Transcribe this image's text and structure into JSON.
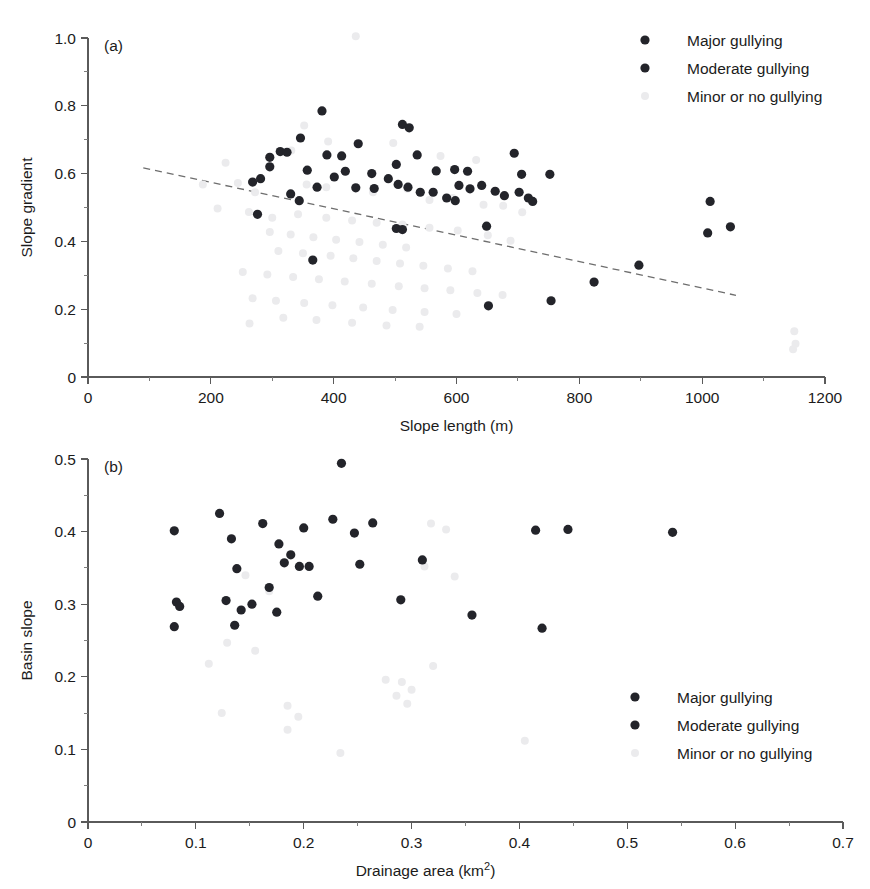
{
  "figure": {
    "width": 870,
    "height": 889,
    "background": "#ffffff",
    "colors": {
      "major": "#23242a",
      "moderate": "#23242a",
      "minor": "#ebebed",
      "axis": "#5a5a5a",
      "trendline": "#6e6e6e",
      "text": "#1b1b1b"
    }
  },
  "legend": {
    "entries": [
      {
        "key": "major",
        "label": "Major gullying",
        "color": "#23242a"
      },
      {
        "key": "moderate",
        "label": "Moderate gullying",
        "color": "#23242a"
      },
      {
        "key": "minor",
        "label": "Minor or no gullying",
        "color": "#ebebed"
      }
    ]
  },
  "chart_data": [
    {
      "id": "panel-a",
      "type": "scatter",
      "panel_label": "(a)",
      "title": "",
      "xlabel": "Slope length (m)",
      "ylabel": "Slope gradient",
      "xlim": [
        0,
        1200
      ],
      "ylim": [
        0,
        1.0
      ],
      "xticks": [
        0,
        200,
        400,
        600,
        800,
        1000,
        1200
      ],
      "xticklabels": [
        "0",
        "200",
        "400",
        "600",
        "800",
        "1000",
        "1200"
      ],
      "yticks": [
        0,
        0.2,
        0.4,
        0.6,
        0.8,
        1.0
      ],
      "yticklabels": [
        "0",
        "0.2",
        "0.4",
        "0.6",
        "0.8",
        "1.0"
      ],
      "xminor_step": 100,
      "yminor_step": 0.1,
      "grid": false,
      "legend_position": "top-right",
      "trendline": {
        "style": "dashed",
        "x": [
          90,
          1055
        ],
        "y": [
          0.617,
          0.241
        ]
      },
      "series": [
        {
          "name": "Major gullying",
          "key": "major",
          "color": "#23242a",
          "points": [
            [
              381,
              0.785
            ],
            [
              346,
              0.705
            ],
            [
              512,
              0.745
            ],
            [
              523,
              0.735
            ],
            [
              313,
              0.665
            ],
            [
              324,
              0.663
            ],
            [
              296,
              0.648
            ],
            [
              389,
              0.655
            ],
            [
              413,
              0.652
            ],
            [
              440,
              0.688
            ],
            [
              296,
              0.62
            ],
            [
              357,
              0.61
            ],
            [
              419,
              0.607
            ],
            [
              401,
              0.59
            ],
            [
              462,
              0.6
            ],
            [
              502,
              0.627
            ],
            [
              536,
              0.655
            ],
            [
              567,
              0.608
            ],
            [
              597,
              0.612
            ],
            [
              618,
              0.607
            ],
            [
              694,
              0.66
            ],
            [
              706,
              0.598
            ],
            [
              752,
              0.598
            ],
            [
              268,
              0.575
            ],
            [
              281,
              0.585
            ],
            [
              330,
              0.54
            ],
            [
              373,
              0.56
            ],
            [
              436,
              0.558
            ],
            [
              466,
              0.556
            ],
            [
              489,
              0.585
            ],
            [
              505,
              0.568
            ],
            [
              521,
              0.56
            ],
            [
              541,
              0.545
            ],
            [
              562,
              0.545
            ],
            [
              584,
              0.528
            ],
            [
              604,
              0.565
            ],
            [
              622,
              0.555
            ],
            [
              641,
              0.565
            ],
            [
              663,
              0.548
            ],
            [
              678,
              0.535
            ],
            [
              702,
              0.545
            ],
            [
              717,
              0.528
            ],
            [
              724,
              0.518
            ],
            [
              276,
              0.48
            ],
            [
              344,
              0.52
            ],
            [
              502,
              0.438
            ],
            [
              512,
              0.435
            ],
            [
              598,
              0.52
            ],
            [
              649,
              0.445
            ],
            [
              1013,
              0.518
            ],
            [
              1009,
              0.425
            ],
            [
              1046,
              0.443
            ],
            [
              652,
              0.21
            ],
            [
              754,
              0.225
            ],
            [
              824,
              0.28
            ],
            [
              897,
              0.33
            ],
            [
              366,
              0.345
            ]
          ]
        },
        {
          "name": "Minor or no gullying",
          "key": "minor",
          "color": "#ebebed",
          "points": [
            [
              436,
              1.005
            ],
            [
              352,
              0.742
            ],
            [
              224,
              0.632
            ],
            [
              331,
              0.668
            ],
            [
              391,
              0.695
            ],
            [
              497,
              0.69
            ],
            [
              574,
              0.652
            ],
            [
              632,
              0.64
            ],
            [
              187,
              0.568
            ],
            [
              244,
              0.572
            ],
            [
              272,
              0.545
            ],
            [
              356,
              0.568
            ],
            [
              388,
              0.56
            ],
            [
              464,
              0.545
            ],
            [
              520,
              0.555
            ],
            [
              556,
              0.522
            ],
            [
              594,
              0.528
            ],
            [
              644,
              0.508
            ],
            [
              676,
              0.505
            ],
            [
              707,
              0.486
            ],
            [
              211,
              0.497
            ],
            [
              262,
              0.487
            ],
            [
              300,
              0.47
            ],
            [
              342,
              0.48
            ],
            [
              388,
              0.47
            ],
            [
              430,
              0.462
            ],
            [
              470,
              0.455
            ],
            [
              512,
              0.45
            ],
            [
              556,
              0.44
            ],
            [
              602,
              0.432
            ],
            [
              651,
              0.418
            ],
            [
              688,
              0.402
            ],
            [
              296,
              0.428
            ],
            [
              330,
              0.42
            ],
            [
              367,
              0.412
            ],
            [
              404,
              0.405
            ],
            [
              442,
              0.398
            ],
            [
              480,
              0.39
            ],
            [
              518,
              0.382
            ],
            [
              310,
              0.372
            ],
            [
              350,
              0.365
            ],
            [
              395,
              0.358
            ],
            [
              432,
              0.35
            ],
            [
              470,
              0.342
            ],
            [
              508,
              0.335
            ],
            [
              546,
              0.328
            ],
            [
              586,
              0.32
            ],
            [
              626,
              0.312
            ],
            [
              252,
              0.31
            ],
            [
              292,
              0.302
            ],
            [
              334,
              0.295
            ],
            [
              376,
              0.288
            ],
            [
              418,
              0.282
            ],
            [
              462,
              0.275
            ],
            [
              506,
              0.268
            ],
            [
              548,
              0.262
            ],
            [
              590,
              0.256
            ],
            [
              634,
              0.248
            ],
            [
              675,
              0.242
            ],
            [
              268,
              0.232
            ],
            [
              306,
              0.225
            ],
            [
              352,
              0.218
            ],
            [
              398,
              0.212
            ],
            [
              448,
              0.205
            ],
            [
              496,
              0.198
            ],
            [
              548,
              0.192
            ],
            [
              600,
              0.186
            ],
            [
              1150,
              0.135
            ],
            [
              1152,
              0.098
            ],
            [
              1148,
              0.082
            ],
            [
              263,
              0.158
            ],
            [
              318,
              0.175
            ],
            [
              372,
              0.168
            ],
            [
              430,
              0.16
            ],
            [
              486,
              0.152
            ],
            [
              540,
              0.148
            ]
          ]
        }
      ]
    },
    {
      "id": "panel-b",
      "type": "scatter",
      "panel_label": "(b)",
      "title": "",
      "xlabel": "Drainage area (km2)",
      "xlabel_base": "Drainage area (km",
      "xlabel_sup": "2",
      "xlabel_tail": ")",
      "ylabel": "Basin slope",
      "xlim": [
        0,
        0.7
      ],
      "ylim": [
        0,
        0.5
      ],
      "xticks": [
        0,
        0.1,
        0.2,
        0.3,
        0.4,
        0.5,
        0.6,
        0.7
      ],
      "xticklabels": [
        "0",
        "0.1",
        "0.2",
        "0.3",
        "0.4",
        "0.5",
        "0.6",
        "0.7"
      ],
      "yticks": [
        0,
        0.1,
        0.2,
        0.3,
        0.4,
        0.5
      ],
      "yticklabels": [
        "0",
        "0.1",
        "0.2",
        "0.3",
        "0.4",
        "0.5"
      ],
      "xminor_step": 0.05,
      "yminor_step": 0.05,
      "grid": false,
      "legend_position": "bottom-right",
      "series": [
        {
          "name": "Major gullying",
          "key": "major",
          "color": "#23242a",
          "points": [
            [
              0.235,
              0.494
            ],
            [
              0.122,
              0.425
            ],
            [
              0.162,
              0.411
            ],
            [
              0.08,
              0.401
            ],
            [
              0.227,
              0.417
            ],
            [
              0.264,
              0.412
            ],
            [
              0.2,
              0.405
            ],
            [
              0.247,
              0.398
            ],
            [
              0.415,
              0.402
            ],
            [
              0.445,
              0.403
            ],
            [
              0.542,
              0.399
            ],
            [
              0.133,
              0.39
            ],
            [
              0.177,
              0.383
            ],
            [
              0.188,
              0.368
            ],
            [
              0.196,
              0.352
            ],
            [
              0.182,
              0.357
            ],
            [
              0.252,
              0.355
            ],
            [
              0.31,
              0.361
            ],
            [
              0.138,
              0.349
            ],
            [
              0.205,
              0.352
            ],
            [
              0.168,
              0.323
            ],
            [
              0.213,
              0.311
            ],
            [
              0.29,
              0.306
            ],
            [
              0.128,
              0.305
            ],
            [
              0.152,
              0.3
            ],
            [
              0.082,
              0.303
            ],
            [
              0.142,
              0.292
            ],
            [
              0.175,
              0.289
            ],
            [
              0.356,
              0.285
            ],
            [
              0.085,
              0.297
            ],
            [
              0.421,
              0.267
            ],
            [
              0.136,
              0.271
            ],
            [
              0.08,
              0.269
            ]
          ]
        },
        {
          "name": "Minor or no gullying",
          "key": "minor",
          "color": "#ebebed",
          "points": [
            [
              0.318,
              0.411
            ],
            [
              0.332,
              0.403
            ],
            [
              0.312,
              0.352
            ],
            [
              0.34,
              0.338
            ],
            [
              0.146,
              0.34
            ],
            [
              0.168,
              0.318
            ],
            [
              0.129,
              0.247
            ],
            [
              0.155,
              0.236
            ],
            [
              0.112,
              0.218
            ],
            [
              0.32,
              0.215
            ],
            [
              0.276,
              0.196
            ],
            [
              0.291,
              0.193
            ],
            [
              0.3,
              0.182
            ],
            [
              0.286,
              0.174
            ],
            [
              0.124,
              0.15
            ],
            [
              0.185,
              0.16
            ],
            [
              0.195,
              0.145
            ],
            [
              0.296,
              0.163
            ],
            [
              0.185,
              0.127
            ],
            [
              0.405,
              0.112
            ],
            [
              0.234,
              0.095
            ]
          ]
        }
      ]
    }
  ]
}
